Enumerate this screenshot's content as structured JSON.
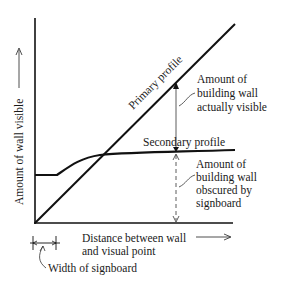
{
  "diagram": {
    "y_axis_label": "Amount of wall visible",
    "x_axis_label_line1": "Distance between wall",
    "x_axis_label_line2": "and visual point",
    "primary_profile_label": "Primary profile",
    "secondary_profile_label": "Secondary profile",
    "visible_annotation": [
      "Amount of",
      "building wall",
      "actually visible"
    ],
    "obscured_annotation": [
      "Amount of",
      "building wall",
      "obscured by",
      "signboard"
    ],
    "signboard_annotation": "Width of signboard",
    "colors": {
      "line": "#111111",
      "text": "#1a1a1a",
      "background": "#ffffff"
    }
  }
}
